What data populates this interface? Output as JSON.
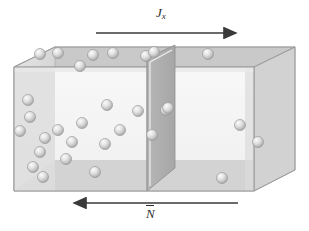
{
  "figure": {
    "title": "",
    "background_color": "#ffffff"
  },
  "annotations": {
    "top_arrow": {
      "label_main": "J",
      "label_sub": "x",
      "direction": "right",
      "x1": 96,
      "x2": 238,
      "y": 33,
      "color": "#3a3a3a",
      "name": "flux-arrow"
    },
    "bottom_arrow": {
      "label_main": "N",
      "overbar": true,
      "direction": "left",
      "x1": 238,
      "x2": 72,
      "y": 203,
      "color": "#3a3a3a",
      "name": "number-density-arrow"
    }
  },
  "box": {
    "front_face_color": "#f4f4f4",
    "top_face_color": "#c9c9c9",
    "left_face_color": "#dcdcdc",
    "right_face_color": "#d0d0d0",
    "floor_band_color": "#cfcfcf",
    "edge_color": "#9a9a9a",
    "partition_color": "#b0b0b0",
    "partition_edge_color": "#8f8f8f"
  },
  "particles": {
    "radius": 5.5,
    "fill_light": "#f2f2f2",
    "fill_mid": "#d2d2d2",
    "fill_dark": "#a8a8a8",
    "stroke": "#9a9a9a",
    "left_region_count": 22,
    "right_region_count": 5,
    "positions_left": [
      [
        40,
        54
      ],
      [
        58,
        53
      ],
      [
        93,
        55
      ],
      [
        113,
        53
      ],
      [
        80,
        66
      ],
      [
        146,
        56
      ],
      [
        30,
        117
      ],
      [
        20,
        131
      ],
      [
        107,
        105
      ],
      [
        82,
        123
      ],
      [
        58,
        130
      ],
      [
        105,
        144
      ],
      [
        40,
        152
      ],
      [
        66,
        159
      ],
      [
        33,
        167
      ],
      [
        43,
        177
      ],
      [
        95,
        172
      ],
      [
        45,
        138
      ],
      [
        72,
        142
      ],
      [
        120,
        130
      ],
      [
        28,
        100
      ],
      [
        138,
        111
      ]
    ],
    "positions_right": [
      [
        208,
        54
      ],
      [
        166,
        110
      ],
      [
        240,
        125
      ],
      [
        258,
        142
      ],
      [
        222,
        178
      ]
    ]
  }
}
